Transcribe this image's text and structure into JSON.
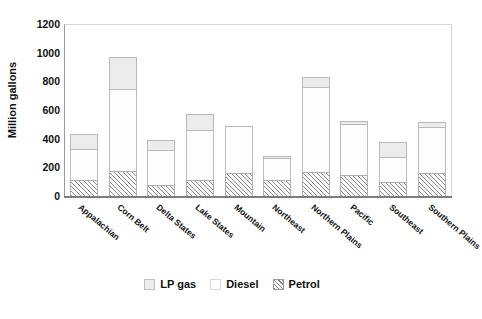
{
  "chart_data": {
    "type": "bar",
    "subtype": "stacked-vertical",
    "title": "",
    "xlabel": "",
    "ylabel": "Million gallons",
    "ylim": [
      0,
      1200
    ],
    "ytick_step": 200,
    "yticks": [
      1200,
      1000,
      800,
      600,
      400,
      200,
      0
    ],
    "grid": false,
    "legend_position": "bottom-center",
    "categories": [
      "Appalachian",
      "Corn Belt",
      "Delta States",
      "Lake States",
      "Mountain",
      "Northeast",
      "Northern Plains",
      "Pacific",
      "Southeast",
      "Southern Plains"
    ],
    "series": [
      {
        "name": "Petrol",
        "fill": "hatched",
        "color": "#8d8d8d",
        "values": [
          115,
          175,
          80,
          110,
          160,
          110,
          165,
          150,
          100,
          160
        ]
      },
      {
        "name": "Diesel",
        "fill": "white",
        "color": "#ffffff",
        "values": [
          215,
          575,
          240,
          350,
          330,
          155,
          595,
          350,
          175,
          325
        ]
      },
      {
        "name": "LP gas",
        "fill": "light-gray",
        "color": "#ececec",
        "values": [
          100,
          220,
          70,
          110,
          0,
          15,
          70,
          25,
          100,
          30
        ]
      }
    ],
    "totals": [
      430,
      970,
      390,
      570,
      490,
      280,
      830,
      525,
      375,
      515
    ]
  },
  "legend": {
    "items": [
      {
        "label": "LP gas",
        "swatch": "lp-gas-swatch"
      },
      {
        "label": "Diesel",
        "swatch": "diesel-swatch"
      },
      {
        "label": "Petrol",
        "swatch": "petrol-swatch"
      }
    ]
  }
}
